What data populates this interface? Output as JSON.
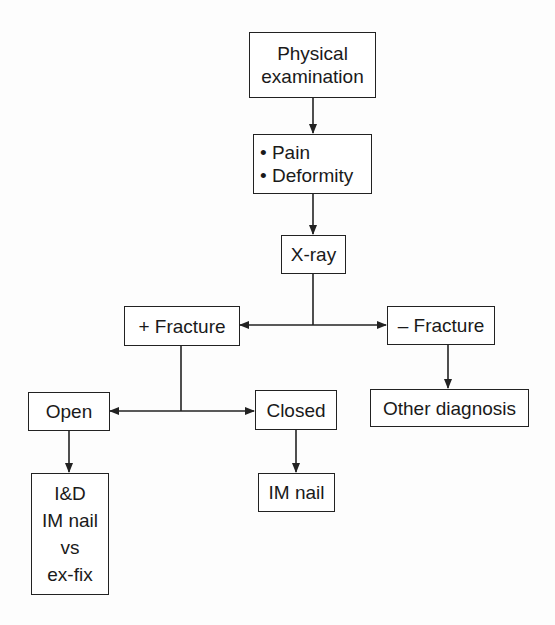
{
  "diagram": {
    "type": "flowchart",
    "nodes": {
      "physical_exam": {
        "lines": [
          "Physical",
          "examination"
        ]
      },
      "symptoms": {
        "lines": [
          "• Pain",
          "• Deformity"
        ]
      },
      "xray": {
        "lines": [
          "X-ray"
        ]
      },
      "pos_fracture": {
        "lines": [
          "+ Fracture"
        ]
      },
      "neg_fracture": {
        "lines": [
          "– Fracture"
        ]
      },
      "open": {
        "lines": [
          "Open"
        ]
      },
      "closed": {
        "lines": [
          "Closed"
        ]
      },
      "other_dx": {
        "lines": [
          "Other diagnosis"
        ]
      },
      "open_tx": {
        "lines": [
          "I&D",
          "IM nail",
          "vs",
          "ex-fix"
        ]
      },
      "closed_tx": {
        "lines": [
          "IM nail"
        ]
      }
    },
    "edges": [
      {
        "from": "physical_exam",
        "to": "symptoms"
      },
      {
        "from": "symptoms",
        "to": "xray"
      },
      {
        "from": "xray",
        "to": "pos_fracture"
      },
      {
        "from": "xray",
        "to": "neg_fracture"
      },
      {
        "from": "pos_fracture",
        "to": "open"
      },
      {
        "from": "pos_fracture",
        "to": "closed"
      },
      {
        "from": "neg_fracture",
        "to": "other_dx"
      },
      {
        "from": "open",
        "to": "open_tx"
      },
      {
        "from": "closed",
        "to": "closed_tx"
      }
    ],
    "colors": {
      "line": "#222222",
      "box_fill": "#ffffff",
      "background": "#fdfdfd"
    }
  }
}
